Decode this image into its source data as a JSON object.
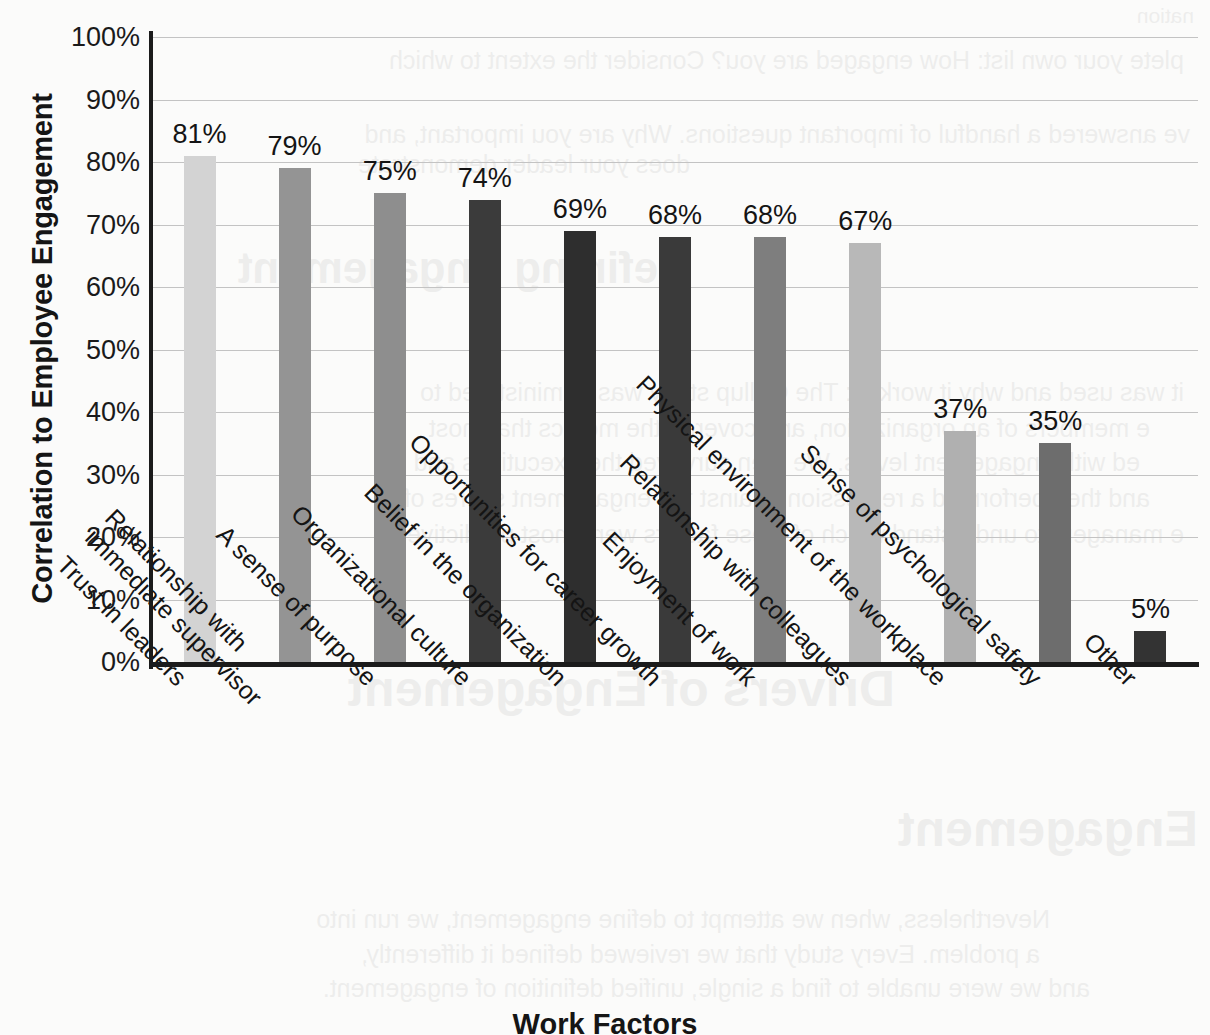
{
  "chart_data": {
    "type": "bar",
    "title": "",
    "xlabel": "Work Factors",
    "ylabel": "Correlation to Employee Engagement",
    "ylim": [
      0,
      100
    ],
    "grid": true,
    "legend": "none",
    "value_suffix": "%",
    "categories": [
      "Trust in leaders",
      "Relationship with\nimmediate supervisor",
      "A sense of purpose",
      "Organizational culture",
      "Belief in the organization",
      "Opportunities for career growth",
      "Enjoyment of work",
      "Relationship with colleagues",
      "Physical environment of the workplace",
      "Sense of psychological safety",
      "Other"
    ],
    "category_lines": [
      [
        "Trust in leaders"
      ],
      [
        "Relationship with",
        "immediate supervisor"
      ],
      [
        "A sense of purpose"
      ],
      [
        "Organizational culture"
      ],
      [
        "Belief in the organization"
      ],
      [
        "Opportunities for career growth"
      ],
      [
        "Enjoyment of work"
      ],
      [
        "Relationship with colleagues"
      ],
      [
        "Physical environment of the workplace"
      ],
      [
        "Sense of psychological safety"
      ],
      [
        "Other"
      ]
    ],
    "values": [
      81,
      79,
      75,
      74,
      69,
      68,
      68,
      67,
      37,
      35,
      5
    ],
    "value_labels": [
      "81%",
      "79%",
      "75%",
      "74%",
      "69%",
      "68%",
      "68%",
      "67%",
      "37%",
      "35%",
      "5%"
    ],
    "bar_colors": [
      "#d3d3d3",
      "#949494",
      "#8e8e8e",
      "#3b3b3b",
      "#2e2e2e",
      "#3a3a3a",
      "#7e7e7e",
      "#b8b8b8",
      "#b0b0b0",
      "#6d6d6d",
      "#333333"
    ],
    "y_ticks": [
      0,
      10,
      20,
      30,
      40,
      50,
      60,
      70,
      80,
      90,
      100
    ],
    "y_tick_labels": [
      "0%",
      "10%",
      "20%",
      "30%",
      "40%",
      "50%",
      "60%",
      "70%",
      "80%",
      "90%",
      "100%"
    ]
  },
  "colors": {
    "background": "#fbfbfa",
    "axis": "#1b1b1b",
    "gridline": "#c3c3c3",
    "text": "#141414"
  },
  "page_bleed": {
    "note": "faint reverse-side show-through text visible in scan",
    "lines": [
      {
        "text": "nation",
        "x": 16,
        "y": 4,
        "size": 21
      },
      {
        "text": "plete your own list: How engaged are you? Consider the extent to which",
        "x": 26,
        "y": 46,
        "size": 25
      },
      {
        "text": "ve answered a handful of important questions. Why are you important, and",
        "x": 20,
        "y": 120,
        "size": 25
      },
      {
        "text": "does your leader demonstrate",
        "x": 520,
        "y": 150,
        "size": 25
      },
      {
        "text": "Defining Engagement",
        "x": 520,
        "y": 243,
        "size": 44
      },
      {
        "text": "it was used and why it worked: The Gallup study was administered to",
        "x": 26,
        "y": 378,
        "size": 25
      },
      {
        "text": "e members of an organization, and covered the metrics that most",
        "x": 60,
        "y": 414,
        "size": 25
      },
      {
        "text": "ed with engagement levels. We then surveyed the executives and",
        "x": 70,
        "y": 448,
        "size": 25
      },
      {
        "text": "and then performed a regression against the engagement scores of",
        "x": 60,
        "y": 484,
        "size": 25
      },
      {
        "text": "e managers to understand which of these factors were most predictive",
        "x": 26,
        "y": 520,
        "size": 25
      },
      {
        "text": "Drivers of Engagement",
        "x": 315,
        "y": 660,
        "size": 50
      },
      {
        "text": "Engagement",
        "x": 12,
        "y": 800,
        "size": 50
      },
      {
        "text": "Nevertheless, when we attempt to define engagement, we run into",
        "x": 160,
        "y": 905,
        "size": 25
      },
      {
        "text": "a problem. Every study that we reviewed defined it differently,",
        "x": 170,
        "y": 940,
        "size": 25
      },
      {
        "text": "and we were unable to find a single, unified definition of engagement.",
        "x": 120,
        "y": 974,
        "size": 25
      }
    ]
  }
}
